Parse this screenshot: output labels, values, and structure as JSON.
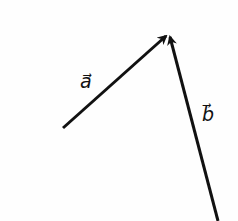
{
  "diagram": {
    "type": "vector-diagram",
    "stroke_color": "#111111",
    "vectors": [
      {
        "id": "a",
        "label": "a",
        "label_text": "a⃗",
        "tail": [
          63,
          128
        ],
        "head": [
          166,
          36
        ],
        "label_pos": [
          80,
          88
        ]
      },
      {
        "id": "b",
        "label": "b",
        "label_text": "b⃗",
        "tail": [
          218,
          221
        ],
        "head": [
          170,
          37
        ],
        "label_pos": [
          202,
          121
        ]
      }
    ]
  }
}
